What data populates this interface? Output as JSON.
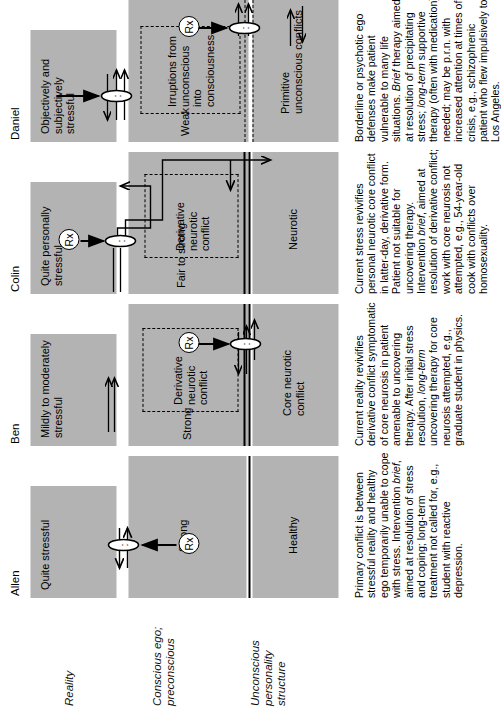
{
  "figure": {
    "orientation": "rotated-90-ccw",
    "band_fill": "#b3b3b3",
    "row_labels": [
      {
        "id": "reality",
        "text": "Reality"
      },
      {
        "id": "conscious",
        "text": "Conscious ego; preconscious"
      },
      {
        "id": "unconscious",
        "text": "Unconscious personality structure"
      }
    ],
    "rx_label": "Rx"
  },
  "cases": [
    {
      "name": "Allen",
      "reality": "Quite stressful",
      "ego_strength": "Strong",
      "derivative_box": null,
      "unconscious": "Healthy",
      "caption_parts": [
        {
          "t": "Primary conflict is between stressful reality and healthy ego temporarily unable to cope with stress. Intervention ",
          "i": false
        },
        {
          "t": "brief",
          "i": true
        },
        {
          "t": ", aimed at resolution of stress and coping; long-term treatment not called for, e.g., student with reactive depression.",
          "i": false
        }
      ]
    },
    {
      "name": "Ben",
      "reality": "Mildly to moderately stressful",
      "ego_strength": "Strong",
      "derivative_box": "Derivative neurotic conflict",
      "unconscious": "Core neurotic conflict",
      "caption_parts": [
        {
          "t": "Current reality revivifies derivative conflict symptomatic of core neurosis in patient amenable to uncovering therapy. After initial stress resolution, ",
          "i": false
        },
        {
          "t": "long-term",
          "i": true
        },
        {
          "t": " uncovering therapy for core neurosis attempted, e.g., graduate student in physics.",
          "i": false
        }
      ]
    },
    {
      "name": "Colin",
      "reality": "Quite personally stressful",
      "ego_strength": "Fair to strong",
      "derivative_box": "Derivative neurotic conflict",
      "unconscious": "Neurotic",
      "caption_parts": [
        {
          "t": "Current stress revivifies personal neurotic core conflict in latter-day, derivative form. Patient not suitable for uncovering therapy. Intervention ",
          "i": false
        },
        {
          "t": "brief",
          "i": true
        },
        {
          "t": ", aimed at resolution of derivative conflict; work with core neurosis not attempted, e.g., 54-year-old cook with conflicts over homosexuality.",
          "i": false
        }
      ]
    },
    {
      "name": "Daniel",
      "reality": "Objectively and subjectively stressful",
      "ego_strength": "Weak",
      "derivative_box": "Irruptions from unconscious into consciousness",
      "unconscious": "Primitive unconscious conflicts",
      "caption_parts": [
        {
          "t": "Borderline or psychotic ego defenses make patient vulnerable to many life situations. ",
          "i": false
        },
        {
          "t": "Brief",
          "i": true
        },
        {
          "t": " therapy aimed at resolution of precipitating stress; ",
          "i": false
        },
        {
          "t": "long-term",
          "i": true
        },
        {
          "t": " supportive therapy (often with medication) needed; may be p.r.n. with increased attention at times of crisis, e.g., schizophrenic patient who flew impulsively to Los Angeles.",
          "i": false
        }
      ]
    }
  ]
}
